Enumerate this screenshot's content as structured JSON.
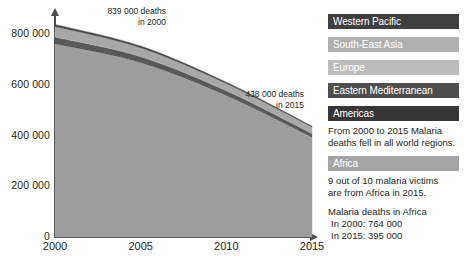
{
  "chart_data": {
    "type": "area",
    "title": "",
    "xlabel": "",
    "ylabel": "",
    "stacked": true,
    "grid": false,
    "legend_position": "right",
    "x": [
      2000,
      2005,
      2010,
      2015
    ],
    "xlim": [
      2000,
      2015
    ],
    "ylim": [
      0,
      880000
    ],
    "yticks": [
      0,
      200000,
      400000,
      600000,
      800000
    ],
    "ytick_labels": [
      "0",
      "200 000",
      "400 000",
      "600 000",
      "800 000"
    ],
    "xtick_labels": [
      "2000",
      "2005",
      "2010",
      "2015"
    ],
    "total_label": "Malaria deaths",
    "totals": {
      "2000": 839000,
      "2015": 438000
    },
    "series": [
      {
        "name": "Africa",
        "color": "#9d9d9d",
        "values": [
          764000,
          690000,
          560000,
          395000
        ]
      },
      {
        "name": "Americas",
        "color": "#3b3b3b",
        "values": [
          3000,
          2500,
          2000,
          1500
        ]
      },
      {
        "name": "Eastern Mediterranean",
        "color": "#585858",
        "values": [
          22000,
          19000,
          15000,
          12000
        ]
      },
      {
        "name": "Europe",
        "color": "#b4b4b4",
        "values": [
          2000,
          1500,
          900,
          300
        ]
      },
      {
        "name": "South-East Asia",
        "color": "#a8a8a8",
        "values": [
          40000,
          34000,
          28000,
          26000
        ]
      },
      {
        "name": "Western Pacific",
        "color": "#4a4a4a",
        "values": [
          8000,
          6500,
          5000,
          3200
        ]
      }
    ],
    "annotations": [
      {
        "id": "annot-2000",
        "text": "839 000 deaths\nin 2000",
        "x": 2000,
        "y": 839000
      },
      {
        "id": "annot-2015",
        "text": "438 000 deaths\nin 2015",
        "x": 2015,
        "y": 438000
      }
    ]
  },
  "legend": {
    "items": [
      {
        "label": "Western Pacific",
        "color": "#3f3f3f",
        "text_color": "#ffffff"
      },
      {
        "label": "South-East Asia",
        "color": "#b0b0b0",
        "text_color": "#ffffff"
      },
      {
        "label": "Europe",
        "color": "#bcbcbc",
        "text_color": "#ffffff"
      },
      {
        "label": "Eastern Mediterranean",
        "color": "#4f4f4f",
        "text_color": "#ffffff"
      },
      {
        "label": "Americas",
        "color": "#363636",
        "text_color": "#ffffff"
      },
      {
        "label": "Africa",
        "color": "#a5a5a5",
        "text_color": "#ffffff"
      }
    ]
  },
  "notes": {
    "regions_note": "From 2000 to 2015 Malaria\ndeaths fell in all world regions.",
    "africa_note": "9 out of 10 malaria victims\nare from Africa in 2015.",
    "africa_deaths_title": "Malaria deaths in Africa",
    "africa_2000": "In 2000: 764 000",
    "africa_2015": "In 2015: 395 000"
  }
}
